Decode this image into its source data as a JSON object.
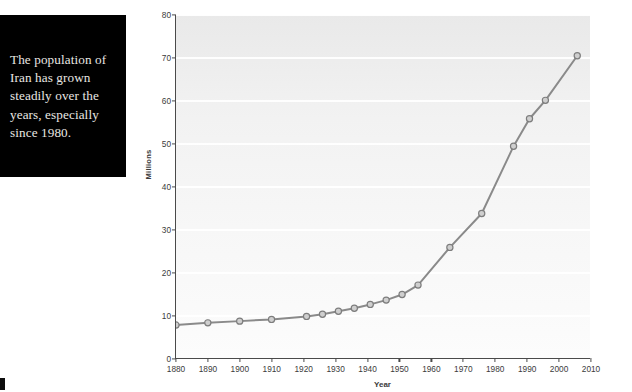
{
  "caption": {
    "text": "The population of Iran has grown steadily over the years, especially since 1980."
  },
  "colors": {
    "caption_background": "#000000",
    "caption_text": "#e9e7e3",
    "plot_background": "#f2f2f2",
    "gridline": "#ffffff",
    "axis": "#4a4a4a",
    "series_line": "#8a8a8a",
    "marker_fill": "#cfcfcf",
    "marker_stroke": "#7d7d7d",
    "tick_text": "#3b3b3b"
  },
  "chart_data": {
    "type": "line",
    "title": "",
    "subtitle": "",
    "xlabel": "Year",
    "ylabel": "Millions",
    "xlim": [
      1880,
      2010
    ],
    "ylim": [
      0,
      80
    ],
    "grid": true,
    "legend": false,
    "legend_position": "none",
    "x_ticks": [
      1880,
      1890,
      1900,
      1910,
      1920,
      1930,
      1940,
      1950,
      1960,
      1970,
      1980,
      1990,
      2000,
      2010
    ],
    "y_ticks": [
      0,
      10,
      20,
      30,
      40,
      50,
      60,
      70,
      80
    ],
    "series": [
      {
        "name": "Population of Iran",
        "x": [
          1880,
          1890,
          1900,
          1910,
          1921,
          1926,
          1931,
          1936,
          1941,
          1946,
          1951,
          1956,
          1966,
          1976,
          1986,
          1991,
          1996,
          2006
        ],
        "values": [
          7.7,
          8.2,
          8.6,
          9.0,
          9.7,
          10.2,
          10.9,
          11.6,
          12.5,
          13.5,
          14.8,
          17.0,
          25.8,
          33.7,
          49.4,
          55.8,
          60.1,
          70.5
        ]
      }
    ]
  }
}
